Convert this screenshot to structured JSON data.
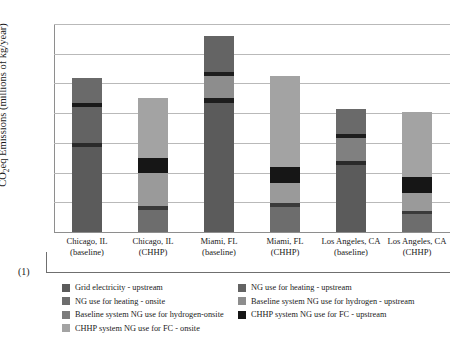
{
  "axis": {
    "ylabel": "CO2eq Emissions (millions of kg/year)",
    "yticks": [
      "7",
      "6",
      "5",
      "4",
      "3",
      "2",
      "1",
      ""
    ],
    "note": "(1)"
  },
  "categories": [
    {
      "line1": "Chicago, IL",
      "line2": "(baseline)"
    },
    {
      "line1": "Chicago, IL",
      "line2": "(CHHP)"
    },
    {
      "line1": "Miami, FL",
      "line2": "(baseline)"
    },
    {
      "line1": "Miami, FL",
      "line2": "(CHHP)"
    },
    {
      "line1": "Los Angeles, CA",
      "line2": "(baseline)"
    },
    {
      "line1": "Los Angeles, CA",
      "line2": "(CHHP)"
    }
  ],
  "legend": {
    "items": [
      {
        "label": "Grid electricity - upstream",
        "color": "#5b5b5b"
      },
      {
        "label": "NG use for heating - onsite",
        "color": "#6d6d6d"
      },
      {
        "label": "Baseline system NG use for hydrogen-onsite",
        "color": "#7b7b7b"
      },
      {
        "label": "CHHP system NG use for FC - onsite",
        "color": "#a3a3a3"
      },
      {
        "label": "NG use for heating - upstream",
        "color": "#636363"
      },
      {
        "label": "Baseline system NG use for hydrogen - upstream",
        "color": "#8d8d8d"
      },
      {
        "label": "CHHP system NG use for FC - upstream",
        "color": "#161616"
      }
    ]
  },
  "chart_data": {
    "type": "bar",
    "subtype": "stacked",
    "title": "",
    "xlabel": "",
    "ylabel": "CO2eq Emissions (millions of kg/year)",
    "ylim": [
      0,
      7
    ],
    "ytick_step": 1,
    "grid": true,
    "legend_position": "bottom",
    "categories": [
      "Chicago, IL (baseline)",
      "Chicago, IL (CHHP)",
      "Miami, FL (baseline)",
      "Miami, FL (CHHP)",
      "Los Angeles, CA (baseline)",
      "Los Angeles, CA (CHHP)"
    ],
    "series": [
      {
        "name": "Grid electricity - upstream",
        "color": "#5b5b5b",
        "values": [
          2.85,
          0.0,
          4.35,
          0.0,
          2.25,
          0.0
        ]
      },
      {
        "name": "NG use for heating - onsite",
        "color": "#6d6d6d",
        "values": [
          0.15,
          0.75,
          0.0,
          0.85,
          0.15,
          0.6
        ]
      },
      {
        "name": "NG use for heating - upstream",
        "color": "#636363",
        "values": [
          1.2,
          0.1,
          0.0,
          0.1,
          0.75,
          0.1
        ]
      },
      {
        "name": "Baseline system NG use for hydrogen-onsite",
        "color": "#7b7b7b",
        "values": [
          0.15,
          0.0,
          0.15,
          0.0,
          0.15,
          0.0
        ]
      },
      {
        "name": "Baseline system NG use for hydrogen - upstream",
        "color": "#8d8d8d",
        "values": [
          0.82,
          0.0,
          0.75,
          0.0,
          0.85,
          0.0
        ]
      },
      {
        "name": "CHHP system NG use for FC - upstream",
        "color": "#161616",
        "values": [
          0.0,
          0.5,
          0.15,
          0.55,
          0.0,
          0.55
        ]
      },
      {
        "name": "CHHP system NG use for FC - onsite",
        "color": "#a3a3a3",
        "values": [
          0.0,
          3.15,
          1.2,
          3.75,
          0.0,
          2.8
        ]
      }
    ],
    "totals": [
      5.17,
      4.5,
      6.6,
      5.25,
      4.15,
      4.05
    ]
  },
  "bars": [
    {
      "name": "Chicago, IL (baseline)",
      "total": 5.17,
      "segments": [
        {
          "from": 0.0,
          "to": 2.85,
          "color": "#5b5b5b"
        },
        {
          "from": 2.85,
          "to": 3.0,
          "color": "#2a2a2a"
        },
        {
          "from": 3.0,
          "to": 4.2,
          "color": "#636363"
        },
        {
          "from": 4.2,
          "to": 4.35,
          "color": "#191919"
        },
        {
          "from": 4.35,
          "to": 5.17,
          "color": "#6a6a6a"
        }
      ]
    },
    {
      "name": "Chicago, IL (CHHP)",
      "total": 4.5,
      "segments": [
        {
          "from": 0.0,
          "to": 0.75,
          "color": "#6d6d6d"
        },
        {
          "from": 0.75,
          "to": 0.87,
          "color": "#3a3a3a"
        },
        {
          "from": 0.87,
          "to": 2.0,
          "color": "#9a9a9a"
        },
        {
          "from": 2.0,
          "to": 2.5,
          "color": "#161616"
        },
        {
          "from": 2.5,
          "to": 4.5,
          "color": "#a3a3a3"
        }
      ]
    },
    {
      "name": "Miami, FL (baseline)",
      "total": 6.6,
      "segments": [
        {
          "from": 0.0,
          "to": 4.35,
          "color": "#5b5b5b"
        },
        {
          "from": 4.35,
          "to": 4.5,
          "color": "#1d1d1d"
        },
        {
          "from": 4.5,
          "to": 5.25,
          "color": "#8d8d8d"
        },
        {
          "from": 5.25,
          "to": 5.4,
          "color": "#1d1d1d"
        },
        {
          "from": 5.4,
          "to": 6.6,
          "color": "#646464"
        }
      ]
    },
    {
      "name": "Miami, FL (CHHP)",
      "total": 5.25,
      "segments": [
        {
          "from": 0.0,
          "to": 0.85,
          "color": "#6d6d6d"
        },
        {
          "from": 0.85,
          "to": 0.97,
          "color": "#3a3a3a"
        },
        {
          "from": 0.97,
          "to": 1.65,
          "color": "#9a9a9a"
        },
        {
          "from": 1.65,
          "to": 2.2,
          "color": "#161616"
        },
        {
          "from": 2.2,
          "to": 5.25,
          "color": "#a3a3a3"
        }
      ]
    },
    {
      "name": "Los Angeles, CA (baseline)",
      "total": 4.15,
      "segments": [
        {
          "from": 0.0,
          "to": 2.25,
          "color": "#5b5b5b"
        },
        {
          "from": 2.25,
          "to": 2.4,
          "color": "#2a2a2a"
        },
        {
          "from": 2.4,
          "to": 3.15,
          "color": "#808080"
        },
        {
          "from": 3.15,
          "to": 3.3,
          "color": "#1d1d1d"
        },
        {
          "from": 3.3,
          "to": 4.15,
          "color": "#6a6a6a"
        }
      ]
    },
    {
      "name": "Los Angeles, CA (CHHP)",
      "total": 4.05,
      "segments": [
        {
          "from": 0.0,
          "to": 0.6,
          "color": "#6d6d6d"
        },
        {
          "from": 0.6,
          "to": 0.72,
          "color": "#3a3a3a"
        },
        {
          "from": 0.72,
          "to": 1.3,
          "color": "#9a9a9a"
        },
        {
          "from": 1.3,
          "to": 1.85,
          "color": "#161616"
        },
        {
          "from": 1.85,
          "to": 4.05,
          "color": "#a3a3a3"
        }
      ]
    }
  ]
}
